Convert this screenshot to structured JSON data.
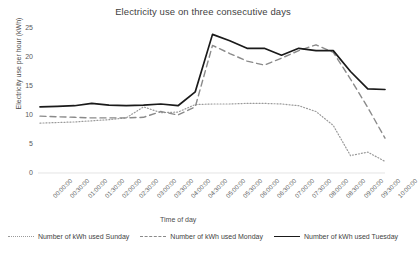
{
  "chart_data": {
    "type": "line",
    "title": "Electricity use on three consecutive days",
    "xlabel": "Time of day",
    "ylabel": "Electricity use per hour (kWh)",
    "ylim": [
      0,
      25
    ],
    "yticks": [
      0,
      5,
      10,
      15,
      20,
      25
    ],
    "grid": false,
    "legend_position": "bottom",
    "categories": [
      "00:00:00",
      "00:30:00",
      "01:00:00",
      "01:30:00",
      "02:00:00",
      "02:30:00",
      "03:00:00",
      "03:30:00",
      "04:00:00",
      "04:30:00",
      "05:00:00",
      "05:30:00",
      "06:00:00",
      "06:30:00",
      "07:00:00",
      "07:30:00",
      "08:00:00",
      "08:30:00",
      "09:00:00",
      "09:30:00",
      "10:00:00"
    ],
    "series": [
      {
        "name": "Number of kWh used Sunday",
        "style": "dotted",
        "color": "#9a9a9a",
        "values": [
          8.6,
          8.7,
          8.8,
          9.0,
          9.2,
          9.5,
          11.4,
          10.4,
          10.5,
          11.8,
          11.9,
          11.9,
          12.0,
          12.0,
          11.9,
          11.6,
          10.6,
          8.2,
          3.0,
          3.6,
          2.0
        ]
      },
      {
        "name": "Number of kWh used Monday",
        "style": "dashed",
        "color": "#8a8a8a",
        "values": [
          9.8,
          9.7,
          9.6,
          9.5,
          9.5,
          9.5,
          9.6,
          10.6,
          10.0,
          11.4,
          22.0,
          20.6,
          19.3,
          18.6,
          19.8,
          21.1,
          22.1,
          20.8,
          16.2,
          11.3,
          6.0
        ]
      },
      {
        "name": "Number of kWh used Tuesday",
        "style": "solid",
        "color": "#1a1a1a",
        "values": [
          11.4,
          11.5,
          11.6,
          12.0,
          11.7,
          11.6,
          11.7,
          11.9,
          11.6,
          14.0,
          23.9,
          22.8,
          21.5,
          21.5,
          20.3,
          21.5,
          21.1,
          21.1,
          17.5,
          14.5,
          14.4
        ]
      }
    ]
  },
  "legend": {
    "items": [
      {
        "label": "Number of kWh used Sunday"
      },
      {
        "label": "Number of kWh used Monday"
      },
      {
        "label": "Number of kWh used Tuesday"
      }
    ]
  }
}
